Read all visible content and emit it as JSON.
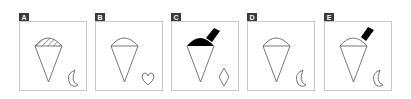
{
  "options": [
    {
      "label": "A",
      "top": "hatched",
      "has_stick": false,
      "side_shape": "crescent"
    },
    {
      "label": "B",
      "top": "outline",
      "has_stick": false,
      "side_shape": "heart"
    },
    {
      "label": "C",
      "top": "solid",
      "has_stick": true,
      "side_shape": "diamond"
    },
    {
      "label": "D",
      "top": "outline",
      "has_stick": false,
      "side_shape": "crescent"
    },
    {
      "label": "E",
      "top": "outline",
      "has_stick": true,
      "side_shape": "crescent"
    }
  ],
  "colors": {
    "label_bg": "#3a3a3a",
    "border": "#c8c8c8",
    "stroke": "#555555",
    "fill": "#000000"
  }
}
